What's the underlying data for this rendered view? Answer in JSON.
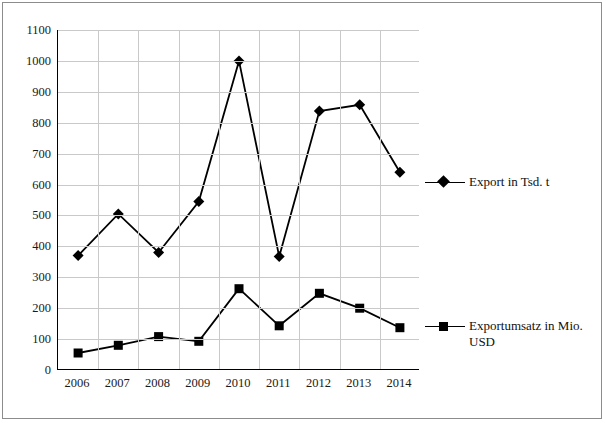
{
  "chart_data": {
    "type": "line",
    "title": "",
    "subtitle": "",
    "xlabel": "",
    "ylabel": "",
    "grid": true,
    "legend_position": "right",
    "categories": [
      "2006",
      "2007",
      "2008",
      "2009",
      "2010",
      "2011",
      "2012",
      "2013",
      "2014"
    ],
    "ylim": [
      0,
      1100
    ],
    "yticks": [
      0,
      100,
      200,
      300,
      400,
      500,
      600,
      700,
      800,
      900,
      1000,
      1100
    ],
    "series": [
      {
        "name": "Export in Tsd. t",
        "marker": "diamond",
        "color": "#000000",
        "values": [
          370,
          505,
          380,
          545,
          1000,
          367,
          838,
          858,
          640
        ]
      },
      {
        "name": "Exportumsatz in Mio. USD",
        "marker": "square",
        "color": "#000000",
        "values": [
          55,
          80,
          108,
          93,
          263,
          143,
          248,
          200,
          137
        ]
      }
    ]
  },
  "legend": {
    "items": [
      {
        "label": "Export in Tsd. t",
        "marker": "diamond-marker-icon"
      },
      {
        "label": "Exportumsatz in Mio. USD",
        "marker": "square-marker-icon"
      }
    ]
  }
}
